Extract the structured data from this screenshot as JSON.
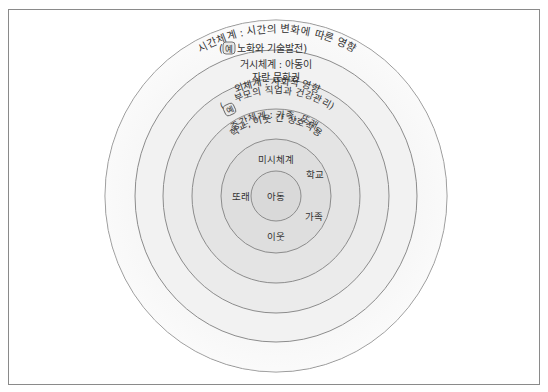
{
  "header": {
    "cut_text": ""
  },
  "diagram": {
    "colors": {
      "stroke": "#8c8c8c",
      "text": "#333333",
      "border": "#8a8a8a",
      "ring_dark": "#d9d9d9",
      "ring_light": "#ffffff"
    },
    "center": {
      "x": 276,
      "y": 196
    },
    "rings": [
      {
        "name": "chronosystem",
        "rx": 171,
        "ry": 176
      },
      {
        "name": "macrosystem",
        "rx": 141,
        "ry": 146
      },
      {
        "name": "exosystem",
        "rx": 113,
        "ry": 117
      },
      {
        "name": "mesosystem",
        "rx": 84,
        "ry": 87
      },
      {
        "name": "microsystem",
        "rx": 55,
        "ry": 57
      },
      {
        "name": "child",
        "rx": 25,
        "ry": 25
      }
    ],
    "labels": {
      "chronosystem_line1": "시간체계 : 시간의 변화에 따른 영향",
      "chronosystem_example_badge": "예",
      "chronosystem_line2": "노화와 기술발전)",
      "chronosystem_line2_open": "(",
      "macrosystem_line1": "거시체계 : 아동이",
      "macrosystem_line2": "자란 문화권",
      "exosystem_line1": "외체계 : 사회적 영향",
      "exosystem_example_badge": "예",
      "exosystem_line2_open": "(",
      "exosystem_line2": "부모의 직업과 건강관리)",
      "mesosystem_line1": "중간체계 : 가족, 또래,",
      "mesosystem_line2": "학교, 이웃 간 상호작용",
      "microsystem_title": "미시체계",
      "micro_school": "학교",
      "micro_peers": "또래",
      "micro_family": "가족",
      "micro_neighbors": "이웃",
      "child": "아동"
    }
  }
}
